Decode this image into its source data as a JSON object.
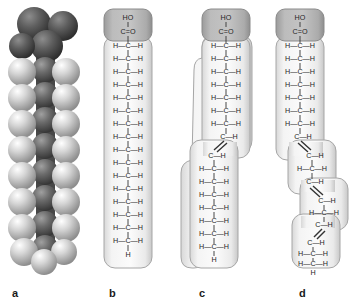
{
  "figure": {
    "background_color": "#ffffff"
  },
  "panels": [
    {
      "id": "a",
      "label": "a",
      "type": "space-filling-model",
      "description": "Space-filling model of a saturated fatty acid",
      "atom_colors": {
        "oxygen": "#4a4a4a",
        "carbon": "#6e6e6e",
        "hydrogen": "#c9c9c9"
      },
      "head_group_units": 2,
      "chain_units": 8
    },
    {
      "id": "b",
      "label": "b",
      "type": "structural-formula",
      "description": "Saturated fatty acid - straight chain",
      "double_bonds": 0,
      "head": {
        "hydroxyl": "HO",
        "carbonyl": "C",
        "oxygen": "O",
        "bond": "="
      },
      "ch2_rows": 16,
      "terminal_h": "H",
      "atom_labels": {
        "left_h": "H",
        "carbon": "C",
        "right_h": "H",
        "dash": "—"
      },
      "colors": {
        "head_fill": "#b4b4b4",
        "tail_fill": "#f2f2f2",
        "outline": "#9a9a9a",
        "bond": "#333333"
      }
    },
    {
      "id": "c",
      "label": "c",
      "type": "structural-formula",
      "description": "Monounsaturated fatty acid - one cis double bond causes a single kink",
      "double_bonds": 1,
      "head": {
        "hydroxyl": "HO",
        "carbonyl": "C",
        "oxygen": "O",
        "bond": "="
      },
      "ch2_rows_upper": 7,
      "ch2_rows_lower": 9,
      "terminal_h": "H",
      "kink_count": 1,
      "colors": {
        "head_fill": "#b4b4b4",
        "tail_fill": "#f2f2f2",
        "outline": "#9a9a9a",
        "bond": "#333333"
      }
    },
    {
      "id": "d",
      "label": "d",
      "type": "structural-formula",
      "description": "Polyunsaturated fatty acid - three cis double bonds cause a stair-step shape",
      "double_bonds": 3,
      "head": {
        "hydroxyl": "HO",
        "carbonyl": "C",
        "oxygen": "O",
        "bond": "="
      },
      "ch2_rows_segment1": 7,
      "ch2_rows_segment2": 2,
      "ch2_rows_segment3": 2,
      "ch2_rows_segment4": 2,
      "terminal_h": "H",
      "kink_count": 3,
      "colors": {
        "head_fill": "#b4b4b4",
        "tail_fill": "#f2f2f2",
        "outline": "#9a9a9a",
        "bond": "#333333"
      }
    }
  ]
}
